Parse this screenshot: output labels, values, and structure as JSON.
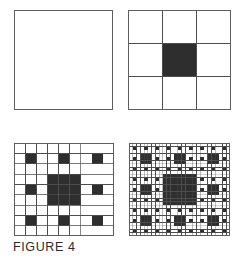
{
  "figure": {
    "caption": "FIGURE 4",
    "title": "FIGURE 4",
    "background_color": "#ffffff",
    "fill_color": "#2e2e2e",
    "line_color": "#4d4d4d",
    "panel_border_color": "#5e5e5e"
  },
  "panels": [
    {
      "id": "panel-0",
      "name": "stage-0-empty-square",
      "label": "Stage 0",
      "iteration": 0,
      "grid_size": 1,
      "grid_lines": false,
      "filled_count": 0,
      "filled_cells": []
    },
    {
      "id": "panel-1",
      "name": "stage-1-three-by-three",
      "label": "Stage 1",
      "iteration": 1,
      "grid_size": 3,
      "grid_lines": true,
      "filled_count": 1,
      "filled_cells": [
        [
          1,
          1
        ]
      ]
    },
    {
      "id": "panel-2",
      "name": "stage-2-nine-by-nine",
      "label": "Stage 2",
      "iteration": 2,
      "grid_size": 9,
      "grid_lines": true,
      "filled_count": 13,
      "filled_cells": [
        [
          1,
          1
        ],
        [
          1,
          4
        ],
        [
          1,
          7
        ],
        [
          3,
          3
        ],
        [
          3,
          4
        ],
        [
          3,
          5
        ],
        [
          4,
          1
        ],
        [
          4,
          3
        ],
        [
          4,
          4
        ],
        [
          4,
          5
        ],
        [
          4,
          7
        ],
        [
          5,
          3
        ],
        [
          5,
          4
        ],
        [
          5,
          5
        ],
        [
          7,
          1
        ],
        [
          7,
          4
        ],
        [
          7,
          7
        ]
      ]
    },
    {
      "id": "panel-3",
      "name": "stage-3-twentyseven-by-twentyseven",
      "label": "Stage 3",
      "iteration": 3,
      "grid_size": 27,
      "grid_lines": true,
      "filled_count": 121,
      "filled_cells": []
    }
  ],
  "chart_data": {
    "type": "diagram",
    "title": "FIGURE 4",
    "subtype": "fractal-iteration-sequence",
    "rule": "At each stage every cell of the previous stage is subdivided into 3x3 subcells; the centre subcell of each white cell is filled black, and cells already black remain wholly black.",
    "stages": [
      {
        "iteration": 0,
        "grid_size": 1,
        "black_cells": 0,
        "total_cells": 1,
        "black_fraction": 0.0
      },
      {
        "iteration": 1,
        "grid_size": 3,
        "black_cells": 1,
        "total_cells": 9,
        "black_fraction": 0.111
      },
      {
        "iteration": 2,
        "grid_size": 9,
        "black_cells": 17,
        "total_cells": 81,
        "black_fraction": 0.21
      },
      {
        "iteration": 3,
        "grid_size": 27,
        "black_cells": 217,
        "total_cells": 729,
        "black_fraction": 0.298
      }
    ],
    "categories": [
      "Stage 0",
      "Stage 1",
      "Stage 2",
      "Stage 3"
    ],
    "values": [
      0,
      1,
      17,
      217
    ],
    "xlabel": "Iteration",
    "ylabel": "Filled cells",
    "legend": []
  }
}
